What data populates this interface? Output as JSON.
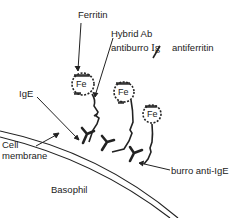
{
  "diagram": {
    "title": "",
    "labels": {
      "ferritin": "Ferritin",
      "hybrid_ab": "Hybrid Ab",
      "hybrid_ab_detail_1": "antiburro ",
      "hybrid_ab_detail_ig": "Ig",
      "hybrid_ab_detail_2": "antiferritin",
      "ige": "IgE",
      "cell_membrane_line1": "Cell",
      "cell_membrane_line2": "membrane",
      "basophil": "Basophil",
      "burro_anti_ige": "burro anti-IgE"
    },
    "fe_labels": [
      "Fe",
      "Fe",
      "Fe"
    ],
    "colors": {
      "ink": "#222222",
      "background": "#ffffff"
    }
  }
}
